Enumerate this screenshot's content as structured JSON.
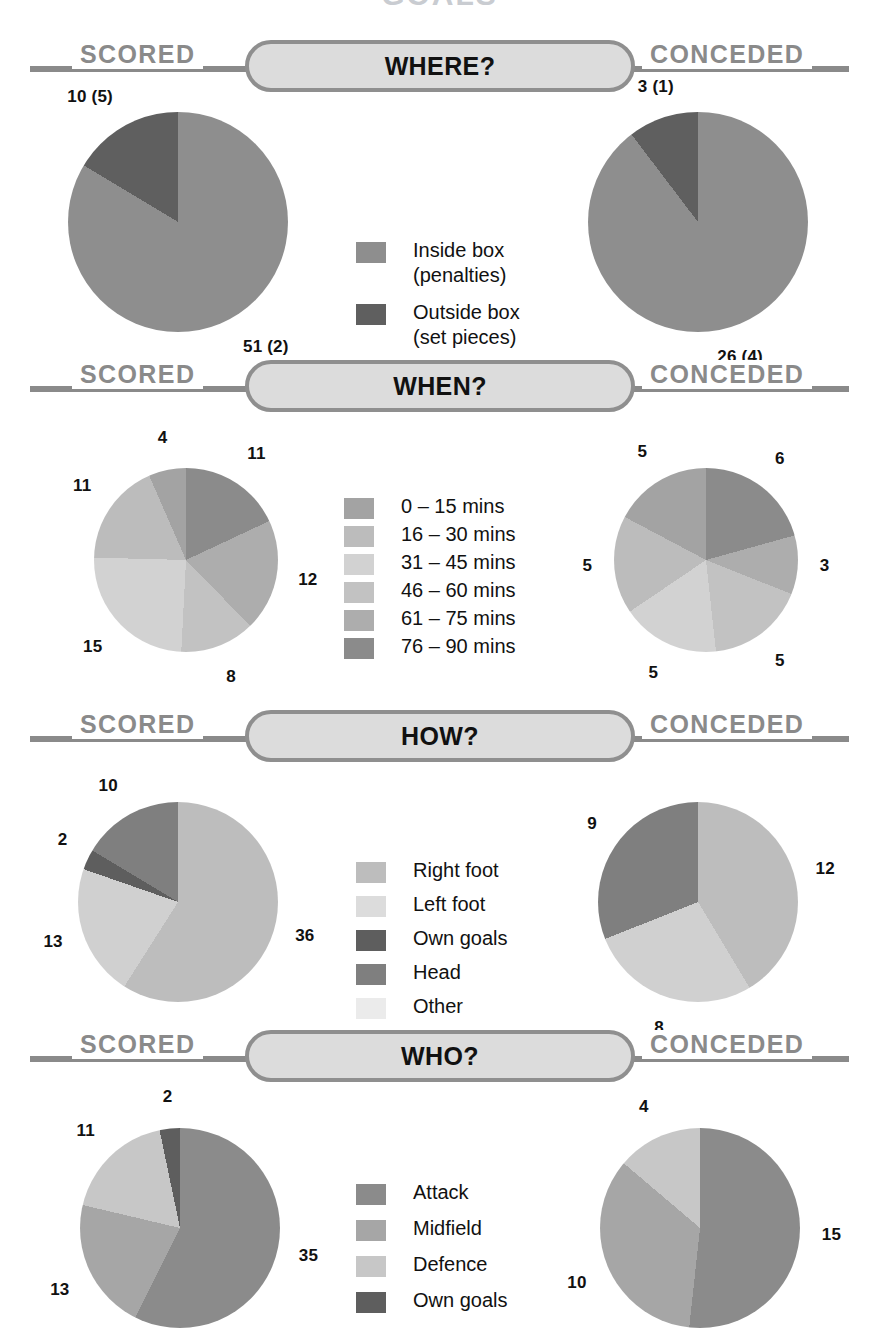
{
  "page": {
    "title_partial": "GOALS",
    "scored_label": "SCORED",
    "conceded_label": "CONCEDED"
  },
  "palette": {
    "rule": "#8a8a8a",
    "pill_fill": "#dcdcdc",
    "pill_border": "#8f8f8f",
    "g_darkest": "#565656",
    "g_dark": "#6e6e6e",
    "g_mid_dark": "#808080",
    "g_mid": "#949494",
    "g_mid_light": "#a8a8a8",
    "g_light": "#bdbdbd",
    "g_lighter": "#cfcfcf",
    "g_lightest": "#e2e2e2"
  },
  "sections": [
    {
      "id": "where",
      "title": "WHERE?",
      "legend": [
        {
          "label": "Inside box\n(penalties)",
          "color": "#8e8e8e"
        },
        {
          "label": "Outside box\n(set pieces)",
          "color": "#5f5f5f"
        }
      ],
      "charts": [
        {
          "side": "SCORED",
          "type": "pie",
          "slices": [
            {
              "label": "51 (2)",
              "value": 51,
              "color": "#8e8e8e",
              "name": "Inside box (penalties)"
            },
            {
              "label": "10 (5)",
              "value": 10,
              "color": "#5f5f5f",
              "name": "Outside box (set pieces)"
            }
          ]
        },
        {
          "side": "CONCEDED",
          "type": "pie",
          "slices": [
            {
              "label": "26 (4)",
              "value": 26,
              "color": "#8e8e8e",
              "name": "Inside box (penalties)"
            },
            {
              "label": "3 (1)",
              "value": 3,
              "color": "#5f5f5f",
              "name": "Outside box (set pieces)"
            }
          ]
        }
      ]
    },
    {
      "id": "when",
      "title": "WHEN?",
      "legend": [
        {
          "label": "0 – 15 mins",
          "color": "#a3a3a3"
        },
        {
          "label": "16 – 30 mins",
          "color": "#bcbcbc"
        },
        {
          "label": "31 – 45 mins",
          "color": "#d2d2d2"
        },
        {
          "label": "46 – 60 mins",
          "color": "#c2c2c2"
        },
        {
          "label": "61 – 75 mins",
          "color": "#adadad"
        },
        {
          "label": "76 – 90 mins",
          "color": "#8b8b8b"
        }
      ],
      "charts": [
        {
          "side": "SCORED",
          "type": "pie",
          "slices": [
            {
              "label": "11",
              "value": 11,
              "color": "#8b8b8b",
              "name": "76 - 90 mins"
            },
            {
              "label": "12",
              "value": 12,
              "color": "#adadad",
              "name": "61 - 75 mins"
            },
            {
              "label": "8",
              "value": 8,
              "color": "#c2c2c2",
              "name": "46 - 60 mins"
            },
            {
              "label": "15",
              "value": 15,
              "color": "#d2d2d2",
              "name": "31 - 45 mins"
            },
            {
              "label": "11",
              "value": 11,
              "color": "#bcbcbc",
              "name": "16 - 30 mins"
            },
            {
              "label": "4",
              "value": 4,
              "color": "#a3a3a3",
              "name": "0 - 15 mins"
            }
          ]
        },
        {
          "side": "CONCEDED",
          "type": "pie",
          "slices": [
            {
              "label": "6",
              "value": 6,
              "color": "#8b8b8b",
              "name": "76 - 90 mins"
            },
            {
              "label": "3",
              "value": 3,
              "color": "#adadad",
              "name": "61 - 75 mins"
            },
            {
              "label": "5",
              "value": 5,
              "color": "#c2c2c2",
              "name": "46 - 60 mins"
            },
            {
              "label": "5",
              "value": 5,
              "color": "#d2d2d2",
              "name": "31 - 45 mins"
            },
            {
              "label": "5",
              "value": 5,
              "color": "#bcbcbc",
              "name": "16 - 30 mins"
            },
            {
              "label": "5",
              "value": 5,
              "color": "#a3a3a3",
              "name": "0 - 15 mins"
            }
          ]
        }
      ]
    },
    {
      "id": "how",
      "title": "HOW?",
      "legend": [
        {
          "label": "Right foot",
          "color": "#bdbdbd"
        },
        {
          "label": "Left foot",
          "color": "#dcdcdc"
        },
        {
          "label": "Own goals",
          "color": "#5e5e5e"
        },
        {
          "label": "Head",
          "color": "#7f7f7f"
        },
        {
          "label": "Other",
          "color": "#ebebeb"
        }
      ],
      "charts": [
        {
          "side": "SCORED",
          "type": "pie",
          "slices": [
            {
              "label": "36",
              "value": 36,
              "color": "#bdbdbd",
              "name": "Right foot"
            },
            {
              "label": "13",
              "value": 13,
              "color": "#d0d0d0",
              "name": "Left foot"
            },
            {
              "label": "2",
              "value": 2,
              "color": "#5e5e5e",
              "name": "Own goals"
            },
            {
              "label": "10",
              "value": 10,
              "color": "#7f7f7f",
              "name": "Head"
            }
          ]
        },
        {
          "side": "CONCEDED",
          "type": "pie",
          "slices": [
            {
              "label": "12",
              "value": 12,
              "color": "#bdbdbd",
              "name": "Right foot"
            },
            {
              "label": "8",
              "value": 8,
              "color": "#d0d0d0",
              "name": "Left foot"
            },
            {
              "label": "9",
              "value": 9,
              "color": "#7f7f7f",
              "name": "Head"
            }
          ]
        }
      ]
    },
    {
      "id": "who",
      "title": "WHO?",
      "legend": [
        {
          "label": "Attack",
          "color": "#8b8b8b"
        },
        {
          "label": "Midfield",
          "color": "#a6a6a6"
        },
        {
          "label": "Defence",
          "color": "#c7c7c7"
        },
        {
          "label": "Own goals",
          "color": "#5e5e5e"
        }
      ],
      "charts": [
        {
          "side": "SCORED",
          "type": "pie",
          "slices": [
            {
              "label": "35",
              "value": 35,
              "color": "#8b8b8b",
              "name": "Attack"
            },
            {
              "label": "13",
              "value": 13,
              "color": "#a6a6a6",
              "name": "Midfield"
            },
            {
              "label": "11",
              "value": 11,
              "color": "#c7c7c7",
              "name": "Defence"
            },
            {
              "label": "2",
              "value": 2,
              "color": "#5e5e5e",
              "name": "Own goals"
            }
          ]
        },
        {
          "side": "CONCEDED",
          "type": "pie",
          "slices": [
            {
              "label": "15",
              "value": 15,
              "color": "#8b8b8b",
              "name": "Attack"
            },
            {
              "label": "10",
              "value": 10,
              "color": "#a6a6a6",
              "name": "Midfield"
            },
            {
              "label": "4",
              "value": 4,
              "color": "#c7c7c7",
              "name": "Defence"
            }
          ]
        }
      ]
    }
  ],
  "chart_data": {
    "type": "pie",
    "title": "GOALS",
    "note": "Eight pie charts in four labelled rows (WHERE? / WHEN? / HOW? / WHO?). Left column = goals SCORED, right column = goals CONCEDED. Numbers in parentheses in the WHERE? row are penalties (inside box) and set pieces (outside box).",
    "charts": [
      {
        "id": "where-scored",
        "row": "WHERE?",
        "side": "SCORED",
        "categories": [
          "Inside box (penalties)",
          "Outside box (set pieces)"
        ],
        "values": [
          51,
          10
        ],
        "sub_values": [
          2,
          5
        ],
        "labels": [
          "51 (2)",
          "10 (5)"
        ]
      },
      {
        "id": "where-conceded",
        "row": "WHERE?",
        "side": "CONCEDED",
        "categories": [
          "Inside box (penalties)",
          "Outside box (set pieces)"
        ],
        "values": [
          26,
          3
        ],
        "sub_values": [
          4,
          1
        ],
        "labels": [
          "26 (4)",
          "3 (1)"
        ]
      },
      {
        "id": "when-scored",
        "row": "WHEN?",
        "side": "SCORED",
        "categories": [
          "0 – 15 mins",
          "16 – 30 mins",
          "31 – 45 mins",
          "46 – 60 mins",
          "61 – 75 mins",
          "76 – 90 mins"
        ],
        "values": [
          4,
          11,
          15,
          8,
          12,
          11
        ]
      },
      {
        "id": "when-conceded",
        "row": "WHEN?",
        "side": "CONCEDED",
        "categories": [
          "0 – 15 mins",
          "16 – 30 mins",
          "31 – 45 mins",
          "46 – 60 mins",
          "61 – 75 mins",
          "76 – 90 mins"
        ],
        "values": [
          5,
          5,
          5,
          5,
          3,
          6
        ]
      },
      {
        "id": "how-scored",
        "row": "HOW?",
        "side": "SCORED",
        "categories": [
          "Right foot",
          "Left foot",
          "Own goals",
          "Head",
          "Other"
        ],
        "values": [
          36,
          13,
          2,
          10,
          0
        ]
      },
      {
        "id": "how-conceded",
        "row": "HOW?",
        "side": "CONCEDED",
        "categories": [
          "Right foot",
          "Left foot",
          "Own goals",
          "Head",
          "Other"
        ],
        "values": [
          12,
          8,
          0,
          9,
          0
        ]
      },
      {
        "id": "who-scored",
        "row": "WHO?",
        "side": "SCORED",
        "categories": [
          "Attack",
          "Midfield",
          "Defence",
          "Own goals"
        ],
        "values": [
          35,
          13,
          11,
          2
        ]
      },
      {
        "id": "who-conceded",
        "row": "WHO?",
        "side": "CONCEDED",
        "categories": [
          "Attack",
          "Midfield",
          "Defence",
          "Own goals"
        ],
        "values": [
          15,
          10,
          4,
          0
        ]
      }
    ]
  }
}
